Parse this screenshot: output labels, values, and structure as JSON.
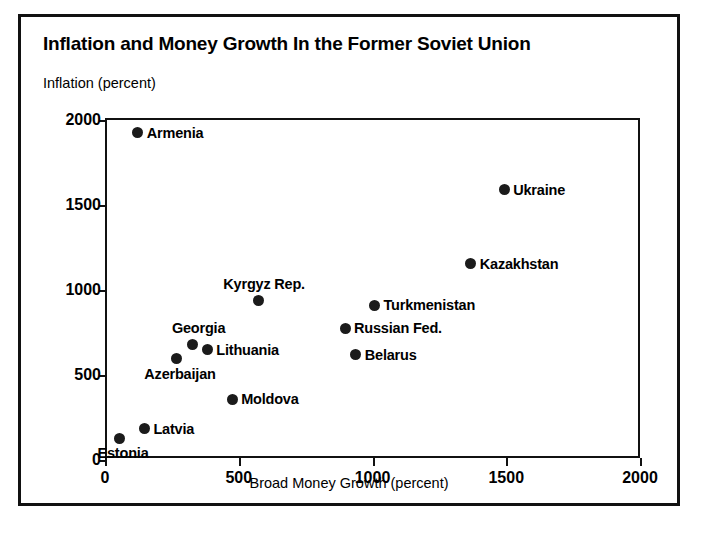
{
  "figure": {
    "title": "Inflation and Money Growth In the Former Soviet Union",
    "y_axis_title": "Inflation (percent)",
    "x_axis_title": "Broad Money Growth (percent)",
    "frame_color": "#111111",
    "marker_color": "#1b1b1b"
  },
  "chart_data": {
    "type": "scatter",
    "title": "Inflation and Money Growth In the Former Soviet Union",
    "xlabel": "Broad Money Growth (percent)",
    "ylabel": "Inflation (percent)",
    "xlim": [
      0,
      2000
    ],
    "ylim": [
      0,
      2000
    ],
    "xticks": [
      0,
      500,
      1000,
      1500,
      2000
    ],
    "yticks": [
      0,
      500,
      1000,
      1500,
      2000
    ],
    "grid": false,
    "legend": "none",
    "points": [
      {
        "name": "Armenia",
        "x": 115,
        "y": 1925,
        "label_pos": "right"
      },
      {
        "name": "Ukraine",
        "x": 1485,
        "y": 1590,
        "label_pos": "right"
      },
      {
        "name": "Kazakhstan",
        "x": 1360,
        "y": 1155,
        "label_pos": "right"
      },
      {
        "name": "Kyrgyz Rep.",
        "x": 565,
        "y": 940,
        "label_pos": "above"
      },
      {
        "name": "Turkmenistan",
        "x": 1000,
        "y": 910,
        "label_pos": "right"
      },
      {
        "name": "Russian Fed.",
        "x": 890,
        "y": 775,
        "label_pos": "right"
      },
      {
        "name": "Georgia",
        "x": 320,
        "y": 680,
        "label_pos": "above"
      },
      {
        "name": "Lithuania",
        "x": 375,
        "y": 650,
        "label_pos": "right"
      },
      {
        "name": "Belarus",
        "x": 930,
        "y": 620,
        "label_pos": "right"
      },
      {
        "name": "Azerbaijan",
        "x": 258,
        "y": 595,
        "label_pos": "below"
      },
      {
        "name": "Moldova",
        "x": 468,
        "y": 358,
        "label_pos": "right"
      },
      {
        "name": "Latvia",
        "x": 140,
        "y": 185,
        "label_pos": "right"
      },
      {
        "name": "Estonia",
        "x": 45,
        "y": 128,
        "label_pos": "below"
      }
    ]
  }
}
